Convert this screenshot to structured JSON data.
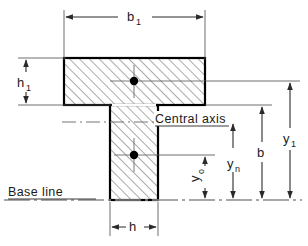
{
  "figure": {
    "type": "engineering-cross-section-diagram",
    "colors": {
      "outline": "#000000",
      "hatch": "#555555",
      "dimension_line": "#4a4a4a",
      "center_line": "#777777",
      "text": "#1a1a1a",
      "background": "#ffffff",
      "centroid_dot": "#000000"
    }
  },
  "labels": {
    "b1": {
      "base": "b",
      "sub": "1"
    },
    "h1": {
      "base": "h",
      "sub": "1"
    },
    "h": {
      "base": "h",
      "sub": ""
    },
    "y1": {
      "base": "y",
      "sub": "1"
    },
    "yn": {
      "base": "y",
      "sub": "n"
    },
    "y0": {
      "base": "y",
      "sub": "o"
    },
    "b": {
      "base": "b",
      "sub": ""
    },
    "central_axis": "Central axis",
    "base_line": "Base line"
  },
  "geometry": {
    "flange": {
      "x": 64,
      "y": 58,
      "width": 141,
      "height": 47
    },
    "web": {
      "x": 110,
      "y": 105,
      "width": 48,
      "height": 95
    },
    "flange_centroid": {
      "cx": 134,
      "cy": 81
    },
    "web_centroid": {
      "cx": 134,
      "cy": 155
    },
    "base_line_y": 200,
    "central_axis_y": 122
  },
  "dimensions": [
    {
      "name": "b1",
      "orientation": "horizontal",
      "from": 64,
      "to": 205,
      "at": 17
    },
    {
      "name": "h1",
      "orientation": "vertical",
      "from": 58,
      "to": 105,
      "at": 26
    },
    {
      "name": "h",
      "orientation": "horizontal",
      "from": 110,
      "to": 158,
      "at": 227
    },
    {
      "name": "y0",
      "orientation": "vertical",
      "from": 155,
      "to": 200,
      "at": 205
    },
    {
      "name": "yn",
      "orientation": "vertical",
      "from": 122,
      "to": 200,
      "at": 233
    },
    {
      "name": "b",
      "orientation": "vertical",
      "from": 105,
      "to": 200,
      "at": 262
    },
    {
      "name": "y1",
      "orientation": "vertical",
      "from": 81,
      "to": 200,
      "at": 290
    }
  ]
}
